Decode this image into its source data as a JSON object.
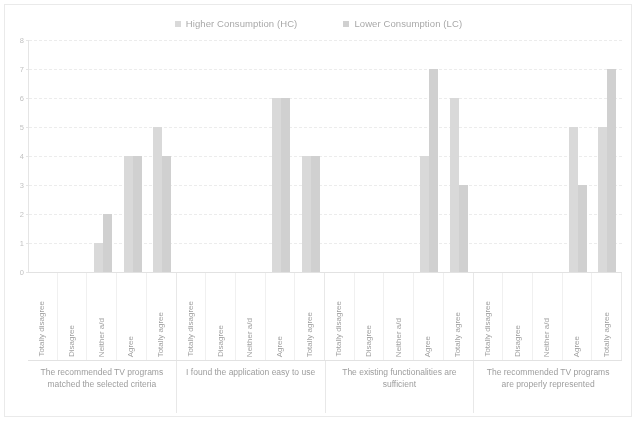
{
  "legend": {
    "items": [
      {
        "label": "Higher Consumption (HC)",
        "color": "#b9b9b9",
        "key": "HC"
      },
      {
        "label": "Lower Consumption (LC)",
        "color": "#a9a9a9",
        "key": "LC"
      }
    ]
  },
  "axis": {
    "y_ticks": [
      "0",
      "1",
      "2",
      "3",
      "4",
      "5",
      "6",
      "7",
      "8"
    ],
    "y_min": 0,
    "y_max": 8
  },
  "categories": [
    "Totally disagree",
    "Disagree",
    "Neither a/d",
    "Agree",
    "Totally agree"
  ],
  "groups": [
    "The recommended TV programs matched the selected criteria",
    "I found the application easy to use",
    "The existing functionalities are sufficient",
    "The recommended TV programs are properly represented"
  ],
  "chart_data": {
    "type": "bar",
    "title": "",
    "xlabel": "",
    "ylabel": "",
    "ylim": [
      0,
      8
    ],
    "grid": true,
    "legend_position": "top-center",
    "categories": [
      "The recommended TV programs matched the selected criteria - Totally disagree",
      "The recommended TV programs matched the selected criteria - Disagree",
      "The recommended TV programs matched the selected criteria - Neither a/d",
      "The recommended TV programs matched the selected criteria - Agree",
      "The recommended TV programs matched the selected criteria - Totally agree",
      "I found the application easy to use - Totally disagree",
      "I found the application easy to use - Disagree",
      "I found the application easy to use - Neither a/d",
      "I found the application easy to use - Agree",
      "I found the application easy to use - Totally agree",
      "The existing functionalities are sufficient - Totally disagree",
      "The existing functionalities are sufficient - Disagree",
      "The existing functionalities are sufficient - Neither a/d",
      "The existing functionalities are sufficient - Agree",
      "The existing functionalities are sufficient - Totally agree",
      "The recommended TV programs are properly represented - Totally disagree",
      "The recommended TV programs are properly represented - Disagree",
      "The recommended TV programs are properly represented - Neither a/d",
      "The recommended TV programs are properly represented - Agree",
      "The recommended TV programs are properly represented - Totally agree"
    ],
    "series": [
      {
        "name": "Higher Consumption (HC)",
        "color": "#b9b9b9",
        "values": [
          0,
          0,
          1,
          4,
          5,
          0,
          0,
          0,
          6,
          4,
          0,
          0,
          0,
          4,
          6,
          0,
          0,
          0,
          5,
          5
        ]
      },
      {
        "name": "Lower Consumption (LC)",
        "color": "#a9a9a9",
        "values": [
          0,
          0,
          2,
          4,
          4,
          0,
          0,
          0,
          6,
          4,
          0,
          0,
          0,
          7,
          3,
          0,
          0,
          0,
          3,
          7
        ]
      }
    ],
    "grouped_by_question": [
      {
        "question": "The recommended TV programs matched the selected criteria",
        "HC": [
          0,
          0,
          1,
          4,
          5
        ],
        "LC": [
          0,
          0,
          2,
          4,
          4
        ]
      },
      {
        "question": "I found the application easy to use",
        "HC": [
          0,
          0,
          0,
          6,
          4
        ],
        "LC": [
          0,
          0,
          0,
          6,
          4
        ]
      },
      {
        "question": "The existing functionalities are sufficient",
        "HC": [
          0,
          0,
          0,
          4,
          6
        ],
        "LC": [
          0,
          0,
          0,
          7,
          3
        ]
      },
      {
        "question": "The recommended TV programs are properly represented",
        "HC": [
          0,
          0,
          0,
          5,
          5
        ],
        "LC": [
          0,
          0,
          0,
          3,
          7
        ]
      }
    ]
  }
}
